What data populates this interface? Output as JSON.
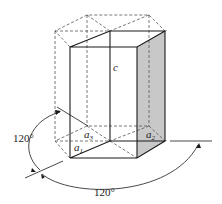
{
  "diagram": {
    "type": "hexagonal-unit-cell",
    "labels": {
      "c": "c",
      "a1": "a",
      "a1_sub": "1",
      "a2": "a",
      "a2_sub": "2",
      "a3": "a",
      "a3_sub": "3",
      "angle_left": "120°",
      "angle_bottom": "120°"
    },
    "colors": {
      "line": "#1a1a1a",
      "dashed": "#555555",
      "shaded_face": "#c8c8c8"
    }
  }
}
